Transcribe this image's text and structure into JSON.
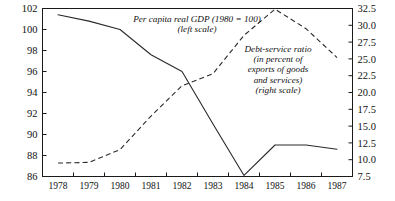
{
  "chart_data": {
    "type": "line",
    "title": "",
    "subtitle": "",
    "xlabel": "",
    "grid": false,
    "legend_position": "inline-annotation",
    "x": [
      1978,
      1979,
      1980,
      1981,
      1982,
      1983,
      1984,
      1985,
      1986,
      1987
    ],
    "xtick_labels": [
      "1978",
      "1979",
      "1980",
      "1981",
      "1982",
      "1983",
      "1984",
      "1985",
      "1986",
      "1987"
    ],
    "xlim": [
      1977.5,
      1987.5
    ],
    "axes": {
      "left": {
        "label": "Per capita real GDP (1980 = 100)",
        "ylim": [
          86,
          102
        ],
        "ticks": [
          86,
          88,
          90,
          92,
          94,
          96,
          98,
          100,
          102
        ],
        "tick_labels": [
          "86",
          "88",
          "90",
          "92",
          "94",
          "96",
          "98",
          "100",
          "102"
        ]
      },
      "right": {
        "label": "Debt-service ratio (in percent of exports of goods and services)",
        "ylim": [
          7.5,
          32.5
        ],
        "ticks": [
          7.5,
          10.0,
          12.5,
          15.0,
          17.5,
          20.0,
          22.5,
          25.0,
          27.5,
          30.0,
          32.5
        ],
        "tick_labels": [
          "7.5",
          "10.0",
          "12.5",
          "15.0",
          "17.5",
          "20.0",
          "22.5",
          "25.0",
          "27.5",
          "30.0",
          "32.5"
        ]
      }
    },
    "series": [
      {
        "name": "Per capita real GDP (1980 = 100)",
        "axis": "left",
        "style": "solid",
        "color": "#2a2a2a",
        "values": [
          101.4,
          100.8,
          100.0,
          97.6,
          96.0,
          91.0,
          86.1,
          89.0,
          89.0,
          88.6
        ]
      },
      {
        "name": "Debt-service ratio (in percent of exports of goods and services)",
        "axis": "right",
        "style": "dashed",
        "color": "#2a2a2a",
        "values": [
          9.5,
          9.6,
          11.5,
          16.5,
          21.0,
          22.8,
          28.5,
          32.4,
          29.5,
          25.2
        ]
      }
    ],
    "annotations": [
      {
        "id": "gdp-annotation",
        "lines": [
          "Per capita real GDP (1980 = 100)",
          "(left scale)"
        ],
        "x_px": 197,
        "y_px": 22
      },
      {
        "id": "debt-annotation",
        "lines": [
          "Debt-service ratio",
          "(in percent of",
          "exports of goods",
          "and services)",
          "(right scale)"
        ],
        "x_px": 278,
        "y_px": 52
      }
    ]
  }
}
